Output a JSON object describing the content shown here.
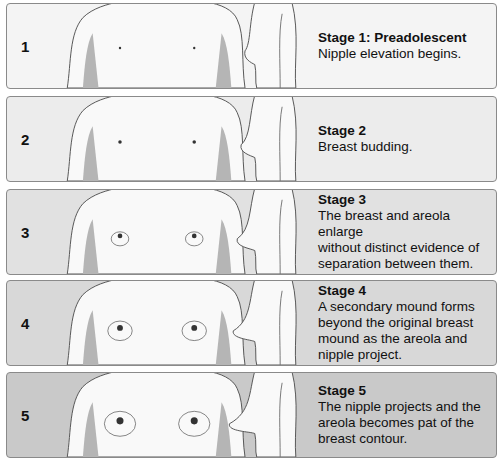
{
  "stages": [
    {
      "number": "1",
      "title": "Stage 1: Preadolescent",
      "description": [
        "Nipple elevation begins."
      ],
      "bg": "#f4f4f4",
      "top": 3
    },
    {
      "number": "2",
      "title": "Stage 2",
      "description": [
        "Breast budding."
      ],
      "bg": "#ececec",
      "top": 96
    },
    {
      "number": "3",
      "title": "Stage 3",
      "description": [
        "The breast and areola enlarge",
        "without distinct evidence of",
        "separation between them."
      ],
      "bg": "#e1e1e1",
      "top": 189
    },
    {
      "number": "4",
      "title": "Stage 4",
      "description": [
        "A secondary mound forms",
        "beyond the original breast",
        "mound as the areola and",
        "nipple project."
      ],
      "bg": "#d8d8d8",
      "top": 280
    },
    {
      "number": "5",
      "title": "Stage 5",
      "description": [
        "The nipple projects and the",
        "areola becomes pat of the",
        "breast contour."
      ],
      "bg": "#c9c9c9",
      "top": 372
    }
  ]
}
